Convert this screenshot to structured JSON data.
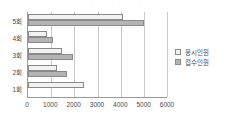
{
  "title_strip": "· · · · · · · · · · · · ·",
  "legend": {
    "position": "right",
    "items": [
      {
        "label": "응시인원",
        "color": "#f2f2f2"
      },
      {
        "label": "접수인원",
        "color": "#b4b4b4"
      }
    ]
  },
  "axis": {
    "x_ticks": [
      "0",
      "1000",
      "2000",
      "3000",
      "4000",
      "5000",
      "6000"
    ],
    "y_ticks": [
      "5회",
      "4회",
      "3회",
      "2회",
      "1회"
    ]
  },
  "chart_data": {
    "type": "bar",
    "orientation": "horizontal",
    "title": "",
    "xlabel": "",
    "ylabel": "",
    "xlim": [
      0,
      6000
    ],
    "grid": true,
    "legend_position": "right",
    "categories": [
      "5회",
      "4회",
      "3회",
      "2회",
      "1회"
    ],
    "series": [
      {
        "name": "응시인원",
        "color": "#f2f2f2",
        "values": [
          4100,
          800,
          1450,
          1250,
          2400
        ]
      },
      {
        "name": "접수인원",
        "color": "#b4b4b4",
        "values": [
          5000,
          1100,
          1950,
          1700,
          0
        ]
      }
    ]
  }
}
